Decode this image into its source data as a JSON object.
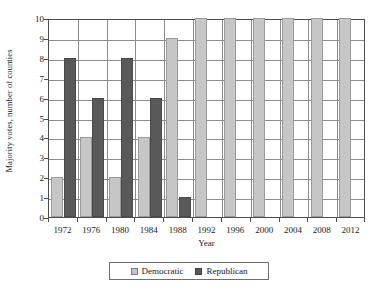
{
  "chart_data": {
    "type": "bar",
    "title": "",
    "subtitle": "",
    "xlabel": "Year",
    "ylabel": "Majority votes, number of counties",
    "categories": [
      "1972",
      "1976",
      "1980",
      "1984",
      "1988",
      "1992",
      "1996",
      "2000",
      "2004",
      "2008",
      "2012"
    ],
    "series": [
      {
        "name": "Democratic",
        "color": "#c6c6c6",
        "values": [
          2,
          4,
          2,
          4,
          9,
          10,
          10,
          10,
          10,
          10,
          10
        ]
      },
      {
        "name": "Republican",
        "color": "#595959",
        "values": [
          8,
          6,
          8,
          6,
          1,
          0,
          0,
          0,
          0,
          0,
          0
        ]
      }
    ],
    "ylim": [
      0,
      10
    ],
    "ytick_labels": [
      "0",
      "1",
      "2",
      "3",
      "4",
      "5",
      "6",
      "7",
      "8",
      "9",
      "10"
    ],
    "ytick_values": [
      0,
      1,
      2,
      3,
      4,
      5,
      6,
      7,
      8,
      9,
      10
    ],
    "grid": "horizontal-and-category-separators",
    "legend_position": "bottom-center",
    "legend_entries": [
      "Democratic",
      "Republican"
    ]
  }
}
